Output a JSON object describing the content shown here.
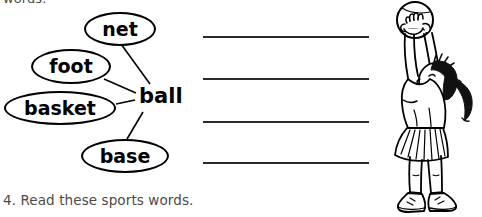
{
  "page": {
    "top_cut_text": "words.",
    "caption": "4. Read these sports words."
  },
  "word_web": {
    "center_word": "ball",
    "bubbles": [
      {
        "label": "net",
        "name": "word-bubble-net"
      },
      {
        "label": "foot",
        "name": "word-bubble-foot"
      },
      {
        "label": "basket",
        "name": "word-bubble-basket"
      },
      {
        "label": "base",
        "name": "word-bubble-base"
      }
    ]
  },
  "writing_lines": {
    "count": 4,
    "values": [
      "",
      "",
      "",
      ""
    ]
  },
  "illustration": {
    "name": "girl-holding-ball-illustration",
    "description": "line drawing of a girl with a ponytail reaching up holding a ball overhead, wearing a t-shirt, pleated skirt and sneakers",
    "ink_color": "#000000",
    "hair_color": "#111111"
  }
}
